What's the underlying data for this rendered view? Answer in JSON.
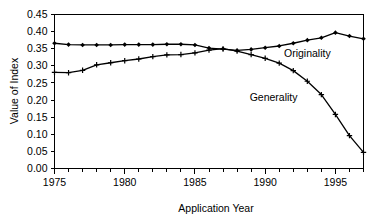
{
  "chart_data": {
    "type": "line",
    "title": "",
    "subtitle": "",
    "xlabel": "Application Year",
    "ylabel": "Value of Index",
    "xlim": [
      1975,
      1997
    ],
    "ylim": [
      0.0,
      0.45
    ],
    "grid": false,
    "legend_position": "inline-annotation",
    "x": [
      1975,
      1976,
      1977,
      1978,
      1979,
      1980,
      1981,
      1982,
      1983,
      1984,
      1985,
      1986,
      1987,
      1988,
      1989,
      1990,
      1991,
      1992,
      1993,
      1994,
      1995,
      1996,
      1997
    ],
    "xticks": [
      1975,
      1980,
      1985,
      1990,
      1995
    ],
    "xtick_labels": [
      "1975",
      "1980",
      "1985",
      "1990",
      "1995"
    ],
    "yticks": [
      0.0,
      0.05,
      0.1,
      0.15,
      0.2,
      0.25,
      0.3,
      0.35,
      0.4,
      0.45
    ],
    "ytick_labels": [
      "0.00",
      "0.05",
      "0.10",
      "0.15",
      "0.20",
      "0.25",
      "0.30",
      "0.35",
      "0.40",
      "0.45"
    ],
    "series": [
      {
        "name": "Originality",
        "marker": "diamond-then-plus",
        "color": "#000000",
        "label_text": "Originality",
        "values": [
          0.366,
          0.362,
          0.361,
          0.361,
          0.361,
          0.362,
          0.362,
          0.362,
          0.363,
          0.363,
          0.361,
          0.352,
          0.349,
          0.345,
          0.348,
          0.353,
          0.358,
          0.366,
          0.375,
          0.382,
          0.397,
          0.387,
          0.379
        ]
      },
      {
        "name": "Generality",
        "marker": "plus-then-diamond",
        "color": "#000000",
        "label_text": "Generality",
        "values": [
          0.281,
          0.28,
          0.287,
          0.303,
          0.309,
          0.315,
          0.32,
          0.327,
          0.332,
          0.333,
          0.338,
          0.346,
          0.35,
          0.343,
          0.333,
          0.322,
          0.308,
          0.286,
          0.255,
          0.216,
          0.158,
          0.096,
          0.047
        ]
      }
    ],
    "annotations": [
      {
        "text": "Originality",
        "x": 1993.0,
        "y": 0.327
      },
      {
        "text": "Generality",
        "x": 1990.6,
        "y": 0.196
      }
    ]
  }
}
